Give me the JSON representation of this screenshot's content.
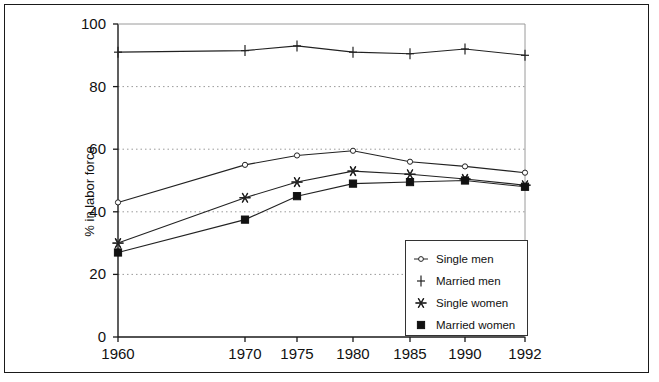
{
  "chart_data": {
    "type": "line",
    "title": "",
    "subtitle": "",
    "xlabel": "",
    "ylabel": "% in labor force",
    "categories": [
      "1960",
      "1970",
      "1975",
      "1980",
      "1985",
      "1990",
      "1992"
    ],
    "x": [
      1960,
      1970,
      1975,
      1980,
      1985,
      1990,
      1992
    ],
    "xlim": [
      1960,
      1992
    ],
    "ylim": [
      0,
      100
    ],
    "yticks": [
      0,
      20,
      40,
      60,
      80,
      100
    ],
    "grid": "horizontal-dotted",
    "legend_position": "inside-lower-right",
    "series": [
      {
        "name": "Single men",
        "marker": "open-circle",
        "values": [
          43,
          55,
          58,
          59.5,
          56,
          54.5,
          52.5
        ]
      },
      {
        "name": "Married men",
        "marker": "plus",
        "values": [
          91,
          91.5,
          93,
          91,
          90.5,
          92,
          90
        ]
      },
      {
        "name": "Single women",
        "marker": "asterisk",
        "values": [
          30,
          44.5,
          49.5,
          53,
          52,
          50.5,
          48.5
        ]
      },
      {
        "name": "Married women",
        "marker": "filled-square",
        "values": [
          27,
          37.5,
          45,
          49,
          49.5,
          50,
          48
        ]
      }
    ]
  },
  "axis": {
    "y_label": "% in labor force",
    "y_ticks": [
      "100",
      "80",
      "60",
      "40",
      "20",
      "0"
    ],
    "x_ticks": [
      "1960",
      "1970",
      "1975",
      "1980",
      "1985",
      "1990",
      "1992"
    ]
  },
  "legend": {
    "items": [
      {
        "label": "Single men"
      },
      {
        "label": "Married men"
      },
      {
        "label": "Single women"
      },
      {
        "label": "Married women"
      }
    ]
  },
  "colors": {
    "line": "#222222",
    "grid": "#9a9a9a",
    "axis": "#1a1a1a",
    "frame": "#1a1a1a",
    "background": "#ffffff"
  }
}
